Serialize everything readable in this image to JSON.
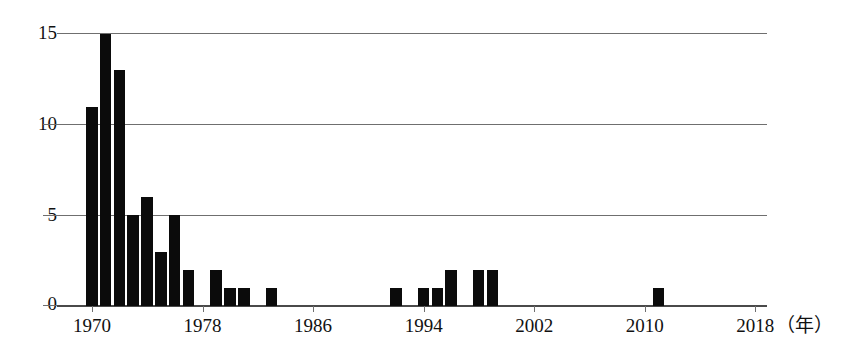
{
  "chart_data": {
    "type": "bar",
    "title": "",
    "subtitle": "",
    "xlabel": "年",
    "ylabel": "",
    "grid": true,
    "legend": null,
    "xlim": [
      1969,
      2018
    ],
    "ylim": [
      0,
      15
    ],
    "y_ticks": [
      0,
      5,
      10,
      15
    ],
    "x_ticks": [
      1970,
      1978,
      1986,
      1994,
      2002,
      2010,
      2018
    ],
    "x_tick_labels": [
      "1970",
      "1978",
      "1986",
      "1994",
      "2002",
      "2010",
      "2018"
    ],
    "bar_color": "#0b0b0b",
    "categories": [
      1970,
      1971,
      1972,
      1973,
      1974,
      1975,
      1976,
      1977,
      1979,
      1980,
      1981,
      1983,
      1992,
      1994,
      1995,
      1996,
      1998,
      1999,
      2011
    ],
    "values": [
      11,
      15,
      13,
      5,
      6,
      3,
      5,
      2,
      2,
      1,
      1,
      1,
      1,
      1,
      1,
      2,
      2,
      2,
      1
    ],
    "annotations": []
  },
  "axis": {
    "unit_label": "（年）"
  }
}
